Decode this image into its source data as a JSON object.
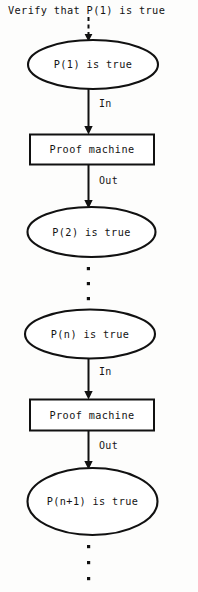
{
  "diagram": {
    "title": "Verify that P(1) is true",
    "caption_note": "",
    "colors": {
      "background": "#fdfdfc",
      "stroke": "#111111",
      "text": "#141414",
      "shape_fill": "#ffffff"
    },
    "nodes": [
      {
        "id": "p1",
        "shape": "ellipse",
        "label": "P(1) is true"
      },
      {
        "id": "pm1",
        "shape": "box",
        "label": "Proof machine"
      },
      {
        "id": "p2",
        "shape": "ellipse",
        "label": "P(2) is true"
      },
      {
        "id": "pn",
        "shape": "ellipse",
        "label": "P(n) is true"
      },
      {
        "id": "pm2",
        "shape": "box",
        "label": "Proof machine"
      },
      {
        "id": "pn1",
        "shape": "ellipse",
        "label": "P(n+1) is true"
      }
    ],
    "edges": [
      {
        "id": "e-verify",
        "from": "title",
        "to": "p1",
        "label": "",
        "style": "dashed"
      },
      {
        "id": "e-in-1",
        "from": "p1",
        "to": "pm1",
        "label": "In",
        "style": "solid"
      },
      {
        "id": "e-out-1",
        "from": "pm1",
        "to": "p2",
        "label": "Out",
        "style": "solid"
      },
      {
        "id": "e-in-2",
        "from": "pn",
        "to": "pm2",
        "label": "In",
        "style": "solid"
      },
      {
        "id": "e-out-2",
        "from": "pm2",
        "to": "pn1",
        "label": "Out",
        "style": "solid"
      }
    ],
    "ellipsis_groups": [
      {
        "id": "ellipsis-middle",
        "between": "p2 and pn",
        "dots": 3
      },
      {
        "id": "ellipsis-bottom",
        "between": "pn1 and end",
        "dots": 3
      }
    ]
  }
}
